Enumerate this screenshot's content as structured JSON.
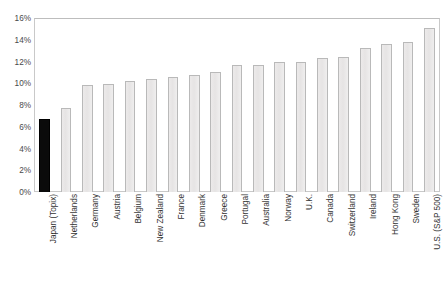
{
  "chart_data": {
    "type": "bar",
    "title": "",
    "xlabel": "",
    "ylabel": "",
    "ylim": [
      0,
      16
    ],
    "ytick_labels": [
      "16%",
      "14%",
      "12%",
      "10%",
      "8%",
      "6%",
      "4%",
      "2%",
      "0%"
    ],
    "ytick_values": [
      16,
      14,
      12,
      10,
      8,
      6,
      4,
      2,
      0
    ],
    "grid": false,
    "legend": "none",
    "value_suffix": "%",
    "categories": [
      "Japan (Topix)",
      "Netherlands",
      "Germany",
      "Austria",
      "Belgium",
      "New Zealand",
      "France",
      "Denmark",
      "Greece",
      "Portugal",
      "Australia",
      "Norway",
      "U.K.",
      "Canada",
      "Switzerland",
      "Ireland",
      "Hong Kong",
      "Sweden",
      "U.S. (S&P 500)"
    ],
    "values": [
      6.7,
      7.7,
      9.8,
      9.9,
      10.2,
      10.4,
      10.6,
      10.8,
      11.0,
      11.7,
      11.7,
      12.0,
      12.0,
      12.3,
      12.4,
      13.2,
      13.6,
      13.8,
      15.1
    ],
    "highlight_index": 0,
    "colors": {
      "bar_fill": "#e9e7e7",
      "bar_border": "#b9b9b9",
      "highlight_fill": "#0b0b0b",
      "highlight_border": "#000000",
      "axis_line": "#c9c9c9",
      "tick_text": "#4a4a4a",
      "label_text": "#333333",
      "background": "#ffffff"
    }
  },
  "caption": {
    "text": ""
  }
}
